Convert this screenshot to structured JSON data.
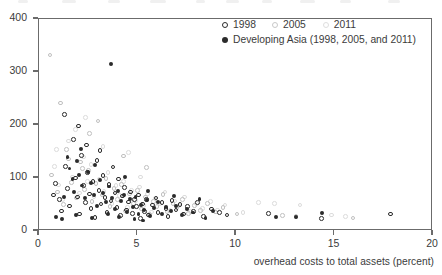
{
  "chart_data": {
    "type": "scatter",
    "title": "",
    "xlabel": "overhead costs to total assets (percent)",
    "ylabel": "",
    "xlim": [
      0,
      20
    ],
    "ylim": [
      0,
      400
    ],
    "xticks": [
      0,
      5,
      10,
      15,
      20
    ],
    "yticks": [
      0,
      100,
      200,
      300,
      400
    ],
    "grid": false,
    "legend_position": "top-right",
    "legend": [
      {
        "name": "1998",
        "style": "open-circle-dark"
      },
      {
        "name": "2005",
        "style": "open-circle-gray"
      },
      {
        "name": "2011",
        "style": "open-circle-light"
      },
      {
        "name": "Developing Asia (1998, 2005, and 2011)",
        "style": "filled-circle-dark"
      }
    ],
    "series": [
      {
        "name": "1998",
        "marker": "open-circle-dark",
        "points": [
          [
            0.9,
            88
          ],
          [
            1.1,
            57
          ],
          [
            1.2,
            36
          ],
          [
            1.4,
            120
          ],
          [
            1.5,
            78
          ],
          [
            1.6,
            45
          ],
          [
            1.8,
            171
          ],
          [
            1.9,
            98
          ],
          [
            2.0,
            62
          ],
          [
            2.1,
            30
          ],
          [
            2.2,
            141
          ],
          [
            2.3,
            84
          ],
          [
            2.4,
            52
          ],
          [
            2.5,
            108
          ],
          [
            2.6,
            68
          ],
          [
            2.7,
            41
          ],
          [
            2.8,
            92
          ],
          [
            2.9,
            24
          ],
          [
            3.0,
            131
          ],
          [
            3.1,
            74
          ],
          [
            3.2,
            49
          ],
          [
            3.3,
            103
          ],
          [
            3.4,
            61
          ],
          [
            3.5,
            33
          ],
          [
            3.6,
            86
          ],
          [
            3.7,
            55
          ],
          [
            3.8,
            119
          ],
          [
            3.9,
            70
          ],
          [
            4.0,
            42
          ],
          [
            4.1,
            96
          ],
          [
            4.2,
            27
          ],
          [
            4.3,
            64
          ],
          [
            4.4,
            80
          ],
          [
            4.5,
            38
          ],
          [
            4.6,
            53
          ],
          [
            4.7,
            72
          ],
          [
            4.8,
            31
          ],
          [
            4.9,
            58
          ],
          [
            5.0,
            44
          ],
          [
            5.1,
            66
          ],
          [
            5.2,
            22
          ],
          [
            5.3,
            49
          ],
          [
            5.4,
            35
          ],
          [
            5.5,
            57
          ],
          [
            5.6,
            28
          ],
          [
            5.8,
            47
          ],
          [
            6.0,
            60
          ],
          [
            6.1,
            33
          ],
          [
            6.3,
            52
          ],
          [
            6.5,
            41
          ],
          [
            6.6,
            25
          ],
          [
            6.8,
            56
          ],
          [
            7.0,
            38
          ],
          [
            7.2,
            48
          ],
          [
            7.4,
            30
          ],
          [
            7.6,
            44
          ],
          [
            7.9,
            35
          ],
          [
            8.1,
            52
          ],
          [
            8.4,
            26
          ],
          [
            8.8,
            40
          ],
          [
            9.2,
            33
          ],
          [
            9.6,
            28
          ],
          [
            11.7,
            31
          ],
          [
            14.4,
            22
          ],
          [
            17.9,
            30
          ],
          [
            2.05,
            196
          ],
          [
            1.35,
            218
          ],
          [
            3.15,
            150
          ],
          [
            0.8,
            66
          ],
          [
            2.45,
            160
          ]
        ]
      },
      {
        "name": "2005",
        "marker": "open-circle-gray",
        "points": [
          [
            0.7,
            104
          ],
          [
            1.0,
            72
          ],
          [
            1.3,
            48
          ],
          [
            1.45,
            152
          ],
          [
            1.7,
            90
          ],
          [
            1.95,
            60
          ],
          [
            2.15,
            128
          ],
          [
            2.35,
            76
          ],
          [
            2.55,
            112
          ],
          [
            2.75,
            54
          ],
          [
            2.95,
            88
          ],
          [
            3.25,
            66
          ],
          [
            3.45,
            97
          ],
          [
            3.65,
            44
          ],
          [
            3.85,
            78
          ],
          [
            4.05,
            58
          ],
          [
            4.25,
            86
          ],
          [
            4.45,
            36
          ],
          [
            4.65,
            68
          ],
          [
            4.85,
            50
          ],
          [
            5.05,
            75
          ],
          [
            5.25,
            40
          ],
          [
            5.45,
            62
          ],
          [
            5.65,
            29
          ],
          [
            5.85,
            54
          ],
          [
            6.05,
            44
          ],
          [
            6.35,
            67
          ],
          [
            6.55,
            34
          ],
          [
            6.85,
            50
          ],
          [
            7.05,
            42
          ],
          [
            7.35,
            58
          ],
          [
            7.65,
            31
          ],
          [
            7.95,
            46
          ],
          [
            8.25,
            37
          ],
          [
            8.6,
            50
          ],
          [
            9.0,
            34
          ],
          [
            9.4,
            43
          ],
          [
            10.1,
            30
          ],
          [
            12.4,
            27
          ],
          [
            13.1,
            25
          ],
          [
            16.0,
            23
          ],
          [
            1.15,
            240
          ],
          [
            2.6,
            182
          ],
          [
            0.6,
            330
          ],
          [
            3.05,
            206
          ],
          [
            4.35,
            140
          ],
          [
            5.5,
            118
          ],
          [
            2.25,
            116
          ],
          [
            1.55,
            134
          ]
        ]
      },
      {
        "name": "2011",
        "marker": "open-circle-light",
        "points": [
          [
            0.85,
            120
          ],
          [
            1.05,
            85
          ],
          [
            1.25,
            58
          ],
          [
            1.55,
            168
          ],
          [
            1.75,
            100
          ],
          [
            2.1,
            70
          ],
          [
            2.3,
            138
          ],
          [
            2.5,
            92
          ],
          [
            2.7,
            124
          ],
          [
            2.85,
            62
          ],
          [
            3.1,
            96
          ],
          [
            3.35,
            73
          ],
          [
            3.55,
            108
          ],
          [
            3.75,
            50
          ],
          [
            3.95,
            84
          ],
          [
            4.15,
            65
          ],
          [
            4.35,
            92
          ],
          [
            4.55,
            42
          ],
          [
            4.75,
            74
          ],
          [
            4.95,
            56
          ],
          [
            5.15,
            81
          ],
          [
            5.35,
            46
          ],
          [
            5.55,
            68
          ],
          [
            5.75,
            34
          ],
          [
            5.95,
            60
          ],
          [
            6.2,
            49
          ],
          [
            6.45,
            72
          ],
          [
            6.7,
            38
          ],
          [
            6.95,
            55
          ],
          [
            7.15,
            46
          ],
          [
            7.45,
            62
          ],
          [
            7.75,
            35
          ],
          [
            8.05,
            50
          ],
          [
            8.35,
            41
          ],
          [
            8.75,
            54
          ],
          [
            9.1,
            38
          ],
          [
            9.5,
            47
          ],
          [
            10.4,
            33
          ],
          [
            11.2,
            52
          ],
          [
            12.0,
            50
          ],
          [
            13.3,
            47
          ],
          [
            14.9,
            28
          ],
          [
            15.6,
            26
          ],
          [
            2.4,
            212
          ],
          [
            1.9,
            190
          ],
          [
            3.3,
            158
          ],
          [
            4.6,
            146
          ],
          [
            0.95,
            152
          ],
          [
            5.2,
            100
          ]
        ]
      },
      {
        "name": "Developing Asia (1998, 2005, and 2011)",
        "marker": "filled-circle-dark",
        "points": [
          [
            3.7,
            313
          ],
          [
            1.5,
            138
          ],
          [
            1.6,
            116
          ],
          [
            1.75,
            96
          ],
          [
            1.85,
            72
          ],
          [
            2.0,
            130
          ],
          [
            2.1,
            104
          ],
          [
            2.25,
            84
          ],
          [
            2.4,
            60
          ],
          [
            2.55,
            110
          ],
          [
            2.7,
            88
          ],
          [
            2.85,
            66
          ],
          [
            3.0,
            46
          ],
          [
            3.15,
            94
          ],
          [
            3.3,
            70
          ],
          [
            3.45,
            52
          ],
          [
            3.6,
            82
          ],
          [
            3.75,
            60
          ],
          [
            3.9,
            40
          ],
          [
            4.05,
            74
          ],
          [
            4.2,
            54
          ],
          [
            4.35,
            66
          ],
          [
            4.5,
            34
          ],
          [
            4.65,
            58
          ],
          [
            4.8,
            44
          ],
          [
            4.95,
            62
          ],
          [
            5.1,
            30
          ],
          [
            5.25,
            48
          ],
          [
            5.4,
            38
          ],
          [
            5.55,
            56
          ],
          [
            5.7,
            26
          ],
          [
            5.9,
            42
          ],
          [
            6.1,
            52
          ],
          [
            6.3,
            30
          ],
          [
            6.5,
            44
          ],
          [
            6.75,
            36
          ],
          [
            7.0,
            46
          ],
          [
            7.3,
            28
          ],
          [
            7.55,
            40
          ],
          [
            7.85,
            33
          ],
          [
            8.2,
            58
          ],
          [
            8.5,
            22
          ],
          [
            8.9,
            36
          ],
          [
            12.1,
            25
          ],
          [
            13.1,
            24
          ],
          [
            14.4,
            32
          ],
          [
            0.9,
            24
          ],
          [
            1.2,
            20
          ],
          [
            1.3,
            62
          ],
          [
            2.2,
            152
          ],
          [
            2.9,
            122
          ],
          [
            4.4,
            100
          ],
          [
            5.6,
            74
          ],
          [
            6.9,
            64
          ],
          [
            3.55,
            30
          ],
          [
            4.1,
            24
          ],
          [
            4.9,
            20
          ],
          [
            5.35,
            18
          ],
          [
            2.75,
            22
          ],
          [
            1.95,
            28
          ]
        ]
      }
    ]
  },
  "axes": {
    "y": {
      "labels": [
        "400",
        "300",
        "200",
        "100",
        "0"
      ]
    },
    "x": {
      "labels": [
        "0",
        "5",
        "10",
        "15",
        "20"
      ]
    },
    "x_title": "overhead costs to total assets (percent)"
  },
  "legend": {
    "year_1998": "1998",
    "year_2005": "2005",
    "year_2011": "2011",
    "developing_asia": "Developing Asia (1998, 2005, and 2011)"
  },
  "colors": {
    "marker_1998": "#2b2b2b",
    "marker_2005": "#c0c0c0",
    "marker_2011": "#dcdcdc",
    "marker_asia": "#2b2b2b",
    "axis": "#6b6b6b",
    "text": "#3b3b3b",
    "background": "#ffffff"
  }
}
